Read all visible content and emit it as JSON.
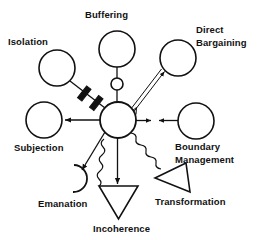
{
  "diagram": {
    "stroke_color": "#111111",
    "background_color": "#ffffff",
    "hub": {
      "name": "central-system-node",
      "shape": "circle",
      "cx": 118,
      "cy": 120,
      "r": 18
    },
    "nodes": [
      {
        "id": "isolation",
        "label": "Isolation",
        "shape": "circle",
        "cx": 57,
        "cy": 68,
        "r": 18,
        "label_x": 8,
        "label_y": 45
      },
      {
        "id": "buffering",
        "label": "Buffering",
        "shape": "circle",
        "cx": 117,
        "cy": 49,
        "r": 18,
        "buffer_cx": 117,
        "buffer_cy": 84,
        "buffer_r": 6,
        "label_x": 85,
        "label_y": 18
      },
      {
        "id": "direct-bargaining",
        "label": "Direct Bargaining",
        "label_line_1": "Direct",
        "label_line_2": "Bargaining",
        "shape": "circle",
        "cx": 178,
        "cy": 58,
        "r": 18,
        "label_x": 196,
        "label_y": 33
      },
      {
        "id": "boundary-management",
        "label": "Boundary Management",
        "label_line_1": "Boundary",
        "label_line_2": "Management",
        "shape": "circle",
        "cx": 196,
        "cy": 121,
        "r": 18,
        "label_x": 175,
        "label_y": 150
      },
      {
        "id": "subjection",
        "label": "Subjection",
        "shape": "circle",
        "cx": 44,
        "cy": 120,
        "r": 18,
        "label_x": 14,
        "label_y": 151
      },
      {
        "id": "emanation",
        "label": "Emanation",
        "shape": "open-arc",
        "cx": 75,
        "cy": 178,
        "r": 14,
        "label_x": 38,
        "label_y": 207
      },
      {
        "id": "incoherence",
        "label": "Incoherence",
        "shape": "triangle-down",
        "cx": 118,
        "cy": 198,
        "size": 22,
        "label_x": 93,
        "label_y": 232
      },
      {
        "id": "transformation",
        "label": "Transformation",
        "shape": "triangle-left",
        "cx": 172,
        "cy": 178,
        "size": 22,
        "label_x": 155,
        "label_y": 205
      }
    ],
    "connectors": [
      {
        "id": "hub-to-isolation",
        "from": "central-system-node",
        "to": "isolation",
        "style": "blocked-line",
        "marker": "two-thick-bars"
      },
      {
        "id": "hub-to-buffering",
        "from": "central-system-node",
        "to": "buffering",
        "style": "line-with-small-circle",
        "marker": "none"
      },
      {
        "id": "hub-to-direct-bargaining",
        "from": "central-system-node",
        "to": "direct-bargaining",
        "style": "double-line",
        "marker": "arrow-both-ends"
      },
      {
        "id": "hub-to-boundary-management",
        "from": "central-system-node",
        "to": "boundary-management",
        "style": "line",
        "marker": "arrows-facing-inward"
      },
      {
        "id": "hub-to-subjection",
        "from": "central-system-node",
        "to": "subjection",
        "style": "line",
        "marker": "arrow-end"
      },
      {
        "id": "hub-to-emanation",
        "from": "central-system-node",
        "to": "emanation",
        "style": "line",
        "marker": "arrow-end"
      },
      {
        "id": "hub-to-incoherence",
        "from": "central-system-node",
        "to": "incoherence",
        "style": "line",
        "marker": "arrow-end"
      },
      {
        "id": "hub-to-incoherence-wavy",
        "from": "central-system-node",
        "to": "incoherence",
        "style": "wavy",
        "marker": "none"
      },
      {
        "id": "hub-to-transformation",
        "from": "central-system-node",
        "to": "transformation",
        "style": "wavy",
        "marker": "none"
      }
    ]
  }
}
